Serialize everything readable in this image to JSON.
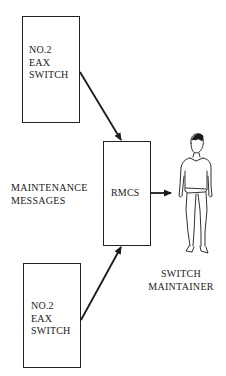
{
  "diagram": {
    "title": "",
    "nodes": {
      "top_switch": {
        "lines": [
          "NO.2",
          "EAX",
          "SWITCH"
        ]
      },
      "rmcs": {
        "lines": [
          "RMCS"
        ]
      },
      "bottom_switch": {
        "lines": [
          "NO.2",
          "EAX",
          "SWITCH"
        ]
      }
    },
    "labels": {
      "maintenance_messages": [
        "MAINTENANCE",
        "MESSAGES"
      ],
      "switch_maintainer": [
        "SWITCH",
        "MAINTAINER"
      ]
    },
    "figure": {
      "icon": "person-icon",
      "description": "standing switch maintainer"
    },
    "edges": [
      {
        "from": "top_switch",
        "to": "rmcs"
      },
      {
        "from": "bottom_switch",
        "to": "rmcs"
      },
      {
        "from": "rmcs",
        "to": "switch_maintainer"
      }
    ],
    "colors": {
      "ink": "#1a1a1a",
      "background": "#ffffff"
    }
  }
}
